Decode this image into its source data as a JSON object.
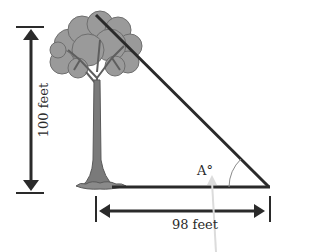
{
  "diagram": {
    "type": "right-triangle-tree",
    "labels": {
      "height": "100 feet",
      "base": "98 feet",
      "angle": "A°"
    },
    "colors": {
      "line": "#2a2a2a",
      "canopy": "#9a9a9a",
      "canopy_dark": "#6e6e6e",
      "trunk": "#7a7a7a",
      "pointer_arrow": "#dcdcdc",
      "arc": "#8a8a8a"
    }
  }
}
